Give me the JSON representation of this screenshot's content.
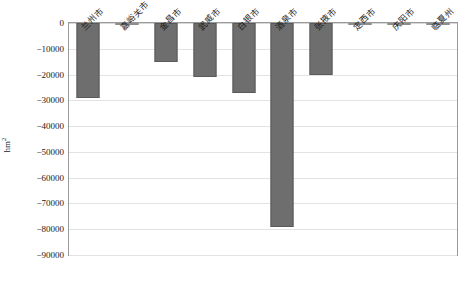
{
  "chart_data": {
    "type": "bar",
    "title": "",
    "subtitle": "",
    "xlabel": "",
    "ylabel": "hm²",
    "ylabel_base": "hm",
    "ylabel_sup": "2",
    "categories": [
      "兰州市",
      "嘉峪关市",
      "金昌市",
      "武威市",
      "白银市",
      "酒泉市",
      "张掖市",
      "定西市",
      "庆阳市",
      "临夏州"
    ],
    "values": [
      -29000,
      -300,
      -15000,
      -21000,
      -27000,
      -79000,
      -20000,
      -200,
      -200,
      -200
    ],
    "ylim": [
      -90000,
      0
    ],
    "yticks": [
      0,
      -10000,
      -20000,
      -30000,
      -40000,
      -50000,
      -60000,
      -70000,
      -80000,
      -90000
    ],
    "ytick_labels": [
      "0",
      "−10000",
      "−20000",
      "−30000",
      "−40000",
      "−50000",
      "−60000",
      "−70000",
      "−80000",
      "−90000"
    ],
    "grid": true,
    "legend": false,
    "bar_color": "#6e6e6e",
    "grid_color": "#e2e2e2",
    "frame_color": "#9a9a9a",
    "text_color": "#1a1a1a"
  }
}
